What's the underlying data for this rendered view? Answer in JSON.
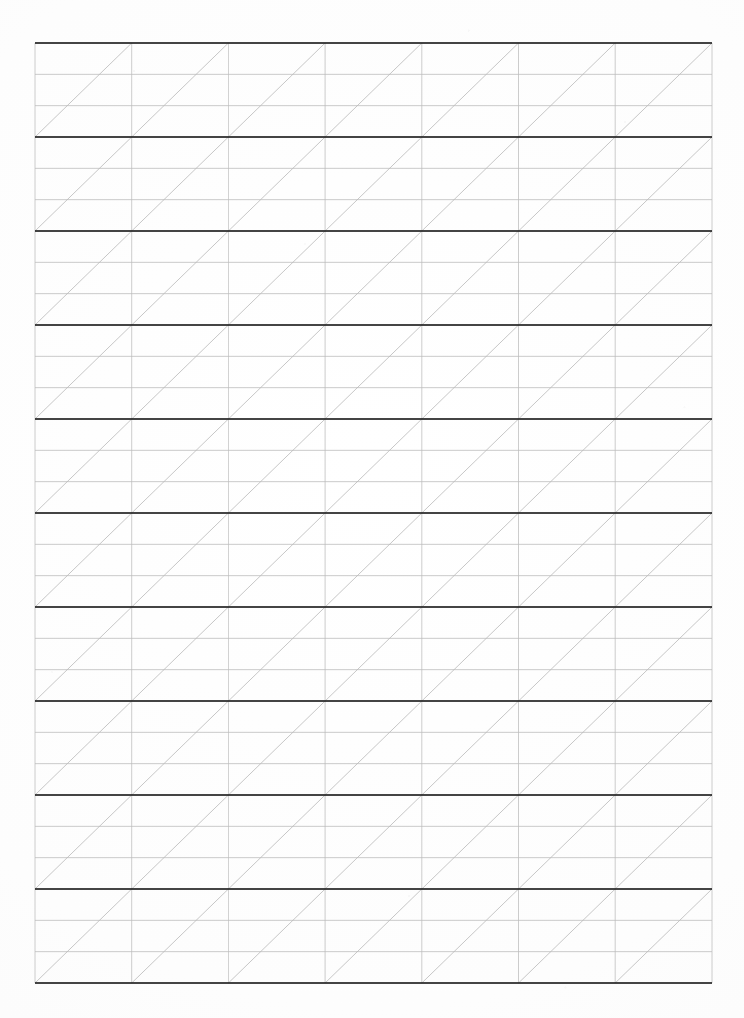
{
  "document": {
    "kind": "scanned-paper-worksheet",
    "title": "Calligraphy Slant Practice Grid",
    "page_width": 744,
    "page_height": 1018,
    "background_color": "#fdfdfd",
    "has_text": false,
    "visible_text_items": []
  },
  "grid": {
    "left": 35,
    "top": 43,
    "right": 712,
    "bottom": 983,
    "columns": 7,
    "rows": 10,
    "column_width": 96.7,
    "row_height": 94.0,
    "column_x_positions": [
      35,
      131.7,
      228.4,
      325.1,
      421.8,
      518.5,
      615.2,
      712
    ],
    "row_y_positions": [
      43,
      137,
      231,
      325,
      419,
      513,
      607,
      701,
      795,
      889,
      983
    ],
    "sublines_per_row": 2,
    "subline_fractions": [
      0.3333,
      0.6667
    ],
    "diagonal": {
      "direction": "bottom-left-to-top-right",
      "per_cell": true,
      "count_per_row": 7
    }
  },
  "colors": {
    "major_line": "#2b2b2b",
    "minor_line": "#b9b9b9",
    "vertical_line": "#bdbdbd",
    "diagonal_line": "#b3b3b3",
    "paper": "#fdfdfd"
  },
  "line_weights": {
    "major_line_px": 1.8,
    "minor_line_px": 0.8,
    "vertical_line_px": 0.8,
    "diagonal_line_px": 0.8
  }
}
